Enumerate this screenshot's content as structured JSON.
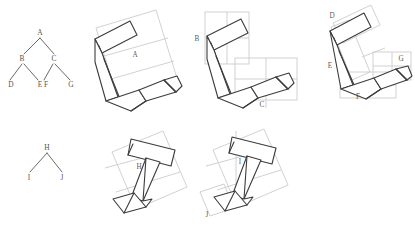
{
  "figure": {
    "type": "hierarchical-shape-decomposition",
    "colors": {
      "shape_stroke": "#3c3c3c",
      "box_stroke": "#c9c9c9",
      "label_text": "#5a5a5a",
      "background": "#ffffff"
    }
  },
  "trees": [
    {
      "name": "tree-abcdefg",
      "root": "A",
      "nodes": [
        "A",
        "B",
        "C",
        "D",
        "E",
        "F",
        "G"
      ],
      "edges": [
        [
          "A",
          "B"
        ],
        [
          "A",
          "C"
        ],
        [
          "B",
          "D"
        ],
        [
          "B",
          "E"
        ],
        [
          "C",
          "F"
        ],
        [
          "C",
          "G"
        ]
      ],
      "positions": {
        "A": {
          "x": 40,
          "y": 33
        },
        "B": {
          "x": 23,
          "y": 59
        },
        "C": {
          "x": 54,
          "y": 59
        },
        "D": {
          "x": 11,
          "y": 84
        },
        "E": {
          "x": 40,
          "y": 84
        },
        "F": {
          "x": 46,
          "y": 84
        },
        "G": {
          "x": 71,
          "y": 84
        }
      }
    },
    {
      "name": "tree-hij",
      "root": "H",
      "nodes": [
        "H",
        "I",
        "J"
      ],
      "edges": [
        [
          "H",
          "I"
        ],
        [
          "H",
          "J"
        ]
      ],
      "positions": {
        "H": {
          "x": 47,
          "y": 148
        },
        "I": {
          "x": 29,
          "y": 177
        },
        "J": {
          "x": 62,
          "y": 177
        }
      }
    }
  ],
  "panels": [
    {
      "name": "panel-a",
      "row": "top",
      "labels": [
        {
          "text": "A",
          "x": 135,
          "y": 55
        }
      ],
      "box_count": 1
    },
    {
      "name": "panel-bc",
      "row": "top",
      "labels": [
        {
          "text": "B",
          "x": 197,
          "y": 39
        },
        {
          "text": "C",
          "x": 262,
          "y": 104
        }
      ],
      "box_count": 3
    },
    {
      "name": "panel-defg",
      "row": "top",
      "labels": [
        {
          "text": "D",
          "x": 332,
          "y": 16
        },
        {
          "text": "E",
          "x": 330,
          "y": 65
        },
        {
          "text": "F",
          "x": 358,
          "y": 96
        },
        {
          "text": "G",
          "x": 401,
          "y": 59
        }
      ],
      "box_count": 5
    },
    {
      "name": "panel-h",
      "row": "bottom",
      "labels": [
        {
          "text": "H",
          "x": 139,
          "y": 167
        }
      ],
      "box_count": 1
    },
    {
      "name": "panel-ij",
      "row": "bottom",
      "labels": [
        {
          "text": "I",
          "x": 240,
          "y": 162
        },
        {
          "text": "J",
          "x": 207,
          "y": 215
        }
      ],
      "box_count": 2
    }
  ]
}
